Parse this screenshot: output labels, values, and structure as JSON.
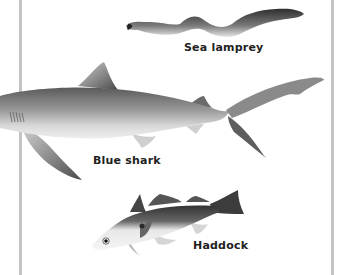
{
  "illustration": {
    "border_color": "#c4c4c4",
    "fish": [
      {
        "id": "sea-lamprey",
        "label": "Sea lamprey"
      },
      {
        "id": "blue-shark",
        "label": "Blue shark"
      },
      {
        "id": "haddock",
        "label": "Haddock"
      }
    ]
  }
}
